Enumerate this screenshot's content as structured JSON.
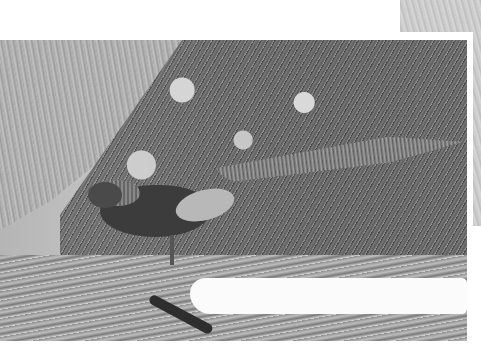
{
  "image": {
    "subject": "Golden pheasant walking on rocky ground with long patterned tail",
    "style": "grayscale photograph",
    "layers": [
      {
        "name": "background-photo",
        "position": "top-right, partially covered"
      },
      {
        "name": "main-photo",
        "position": "center, white border"
      }
    ]
  }
}
